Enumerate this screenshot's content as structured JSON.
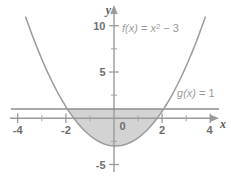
{
  "figure": {
    "title": "",
    "background_color": "#ffffff"
  },
  "chart_data": {
    "type": "line",
    "title": "",
    "xlabel": "x",
    "ylabel": "y",
    "xlim": [
      -4.7,
      4.6
    ],
    "ylim": [
      -6.2,
      11.0
    ],
    "grid": false,
    "legend": "inline-annotations",
    "x_ticks_major": [
      -4,
      -2,
      0,
      2,
      4
    ],
    "x_tick_labels": [
      "-4",
      "-2",
      "0",
      "2",
      "4"
    ],
    "x_ticks_minor": [
      -3,
      -1,
      1,
      3
    ],
    "y_ticks_major": [
      -5,
      0,
      5,
      10
    ],
    "y_tick_labels": [
      "-5",
      "0",
      "5",
      "10"
    ],
    "y_ticks_minor": [
      -2.5,
      2.5,
      7.5
    ],
    "series": [
      {
        "name": "f(x) = x^2 - 3",
        "label": "f(x) = x² − 3",
        "type": "parabola",
        "equation": "y = x^2 - 3",
        "vertex": [
          0,
          -3
        ],
        "color": "#9b9b9b",
        "points": [
          [
            -3.6,
            9.96
          ],
          [
            -3.0,
            6.0
          ],
          [
            -2.5,
            3.25
          ],
          [
            -2.0,
            1.0
          ],
          [
            -1.5,
            -0.75
          ],
          [
            -1.0,
            -2.0
          ],
          [
            -0.5,
            -2.75
          ],
          [
            0,
            -3
          ],
          [
            0.5,
            -2.75
          ],
          [
            1.0,
            -2.0
          ],
          [
            1.5,
            -0.75
          ],
          [
            2.0,
            1.0
          ],
          [
            2.5,
            3.25
          ],
          [
            3.0,
            6.0
          ],
          [
            3.6,
            9.96
          ]
        ]
      },
      {
        "name": "g(x) = 1",
        "label": "g(x) = 1",
        "type": "horizontal-line",
        "equation": "y = 1",
        "y_value": 1,
        "color": "#8c8c8c",
        "x_start": -4.35,
        "x_end": 4.3
      }
    ],
    "shaded_region": {
      "description": "Region between g(x)=1 and f(x)=x^2-3",
      "x_from": -2,
      "x_to": 2,
      "upper_bound": "g(x) = 1",
      "lower_bound": "f(x) = x^2 - 3",
      "fill_color": "#d3d3d3"
    },
    "intersections": [
      [
        -2,
        1
      ],
      [
        2,
        1
      ]
    ],
    "annotations": [
      {
        "text": "f(x) = x² − 3",
        "x": 1.1,
        "y": 9.0
      },
      {
        "text": "g(x) = 1",
        "x": 2.75,
        "y": 2.6
      }
    ]
  },
  "labels": {
    "f_prefix": "f",
    "f_arg": "(x)",
    "f_equals": " = ",
    "f_var": "x",
    "f_exp": "2",
    "f_minus": " − 3",
    "g_prefix": "g",
    "g_arg": "(x)",
    "g_equals": " = 1",
    "axis_x": "x",
    "axis_y": "y",
    "xtick_m4": "-4",
    "xtick_m2": "-2",
    "xtick_0": "0",
    "xtick_2": "2",
    "xtick_4": "4",
    "ytick_10": "10",
    "ytick_5": "5",
    "ytick_m5": "-5"
  },
  "colors": {
    "axis": "#9a9a9a",
    "curve": "#9b9b9b",
    "line": "#8c8c8c",
    "fill": "#d3d3d3",
    "text": "#6e6e6e",
    "annotation": "#9a9a9a"
  }
}
